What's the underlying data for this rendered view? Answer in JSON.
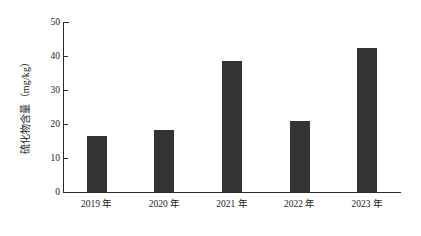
{
  "chart_data": {
    "type": "bar",
    "title": "",
    "xlabel": "",
    "ylabel": "硫化物含量（mg/kg）",
    "categories": [
      "2019 年",
      "2020 年",
      "2021 年",
      "2022 年",
      "2023 年"
    ],
    "values": [
      16.5,
      18.3,
      38.5,
      21.0,
      42.4
    ],
    "ylim": [
      0,
      50
    ],
    "ytick_labels": [
      "0",
      "10",
      "20",
      "30",
      "40",
      "50"
    ],
    "ytick_values": [
      0,
      10,
      20,
      30,
      40,
      50
    ],
    "grid": false,
    "legend": false,
    "legend_position": "none",
    "series": [
      {
        "name": "硫化物含量",
        "values": [
          16.5,
          18.3,
          38.5,
          21.0,
          42.4
        ]
      }
    ],
    "bar_color": "#333333",
    "axis_color": "#2b2b2b",
    "background_color": "#ffffff"
  }
}
